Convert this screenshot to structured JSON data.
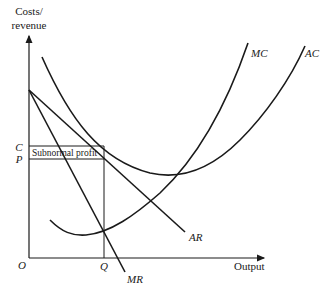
{
  "diagram": {
    "y_axis": {
      "label_line1": "Costs/",
      "label_line2": "revenue"
    },
    "x_axis": {
      "label": "Output"
    },
    "origin_label": "O",
    "price_labels": {
      "C": "C",
      "P": "P"
    },
    "quantity_label": "Q",
    "area_label": "Subnormal profit",
    "curves": {
      "MC": "MC",
      "AC": "AC",
      "AR": "AR",
      "MR": "MR"
    },
    "colors": {
      "ink": "#1a1a1a",
      "background": "#ffffff"
    }
  }
}
